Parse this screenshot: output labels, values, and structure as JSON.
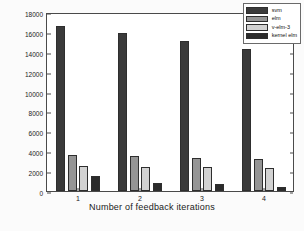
{
  "chart_data": {
    "type": "bar",
    "title": "",
    "xlabel": "Number of feedback iterations",
    "ylabel": "Time(second)",
    "categories": [
      "1",
      "2",
      "3",
      "4"
    ],
    "ylim": [
      0,
      18000
    ],
    "yticks": [
      0,
      2000,
      4000,
      6000,
      8000,
      10000,
      12000,
      14000,
      16000,
      18000
    ],
    "ytick_labels": [
      "0",
      "2000",
      "4000",
      "6000",
      "8000",
      "10000",
      "12000",
      "14000",
      "16000",
      "18000"
    ],
    "grid": false,
    "legend_position": "top-right",
    "series": [
      {
        "name": "svm",
        "color": "#3a3a3a",
        "values": [
          16600,
          15850,
          15100,
          14300
        ]
      },
      {
        "name": "elm",
        "color": "#959595",
        "values": [
          3600,
          3480,
          3330,
          3260
        ]
      },
      {
        "name": "v-elm-3",
        "color": "#d2d2d2",
        "values": [
          2520,
          2400,
          2400,
          2280
        ]
      },
      {
        "name": "kernel elm",
        "color": "#2b2b2b",
        "values": [
          1520,
          800,
          750,
          400
        ]
      }
    ]
  },
  "legend": {
    "entries": [
      "svm",
      "elm",
      "v-elm-3",
      "kernel elm"
    ]
  },
  "axes": {
    "y_label": "Time(second)",
    "x_label": "Number of feedback iterations"
  }
}
